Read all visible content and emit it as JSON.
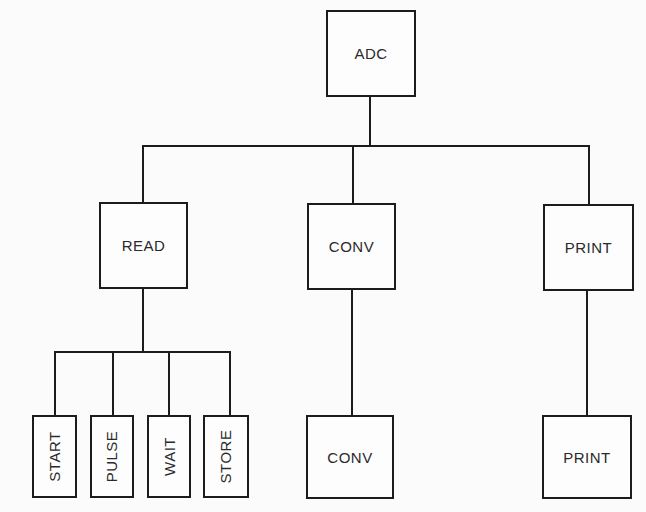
{
  "diagram": {
    "type": "hierarchy-chart",
    "root": {
      "label": "ADC"
    },
    "level1": [
      {
        "label": "READ"
      },
      {
        "label": "CONV"
      },
      {
        "label": "PRINT"
      }
    ],
    "level2_read": [
      {
        "label": "START"
      },
      {
        "label": "PULSE"
      },
      {
        "label": "WAIT"
      },
      {
        "label": "STORE"
      }
    ],
    "level2_conv": {
      "label": "CONV"
    },
    "level2_print": {
      "label": "PRINT"
    },
    "edges": [
      [
        "ADC",
        "READ"
      ],
      [
        "ADC",
        "CONV"
      ],
      [
        "ADC",
        "PRINT"
      ],
      [
        "READ",
        "START"
      ],
      [
        "READ",
        "PULSE"
      ],
      [
        "READ",
        "WAIT"
      ],
      [
        "READ",
        "STORE"
      ],
      [
        "CONV",
        "CONV"
      ],
      [
        "PRINT",
        "PRINT"
      ]
    ]
  }
}
